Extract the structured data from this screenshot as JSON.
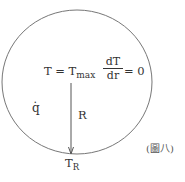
{
  "diagram": {
    "shape": "sphere-cross-section",
    "colors": {
      "stroke": "#666666",
      "text": "#333333"
    },
    "center_condition": {
      "T_label": "T = T",
      "T_sub": "max",
      "derivative_num": "dT",
      "derivative_den": "dr",
      "derivative_eq": "= 0"
    },
    "heat_generation_label": "q̇",
    "radius_label": "R",
    "surface_temp": {
      "base": "T",
      "sub": "R"
    },
    "figure_label": "(圖八)"
  }
}
